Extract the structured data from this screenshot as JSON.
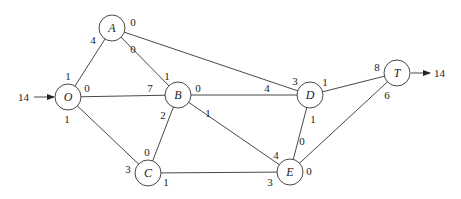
{
  "diagram": {
    "type": "network-flow-graph",
    "source_inflow": {
      "value": "14",
      "into": "O"
    },
    "sink_outflow": {
      "value": "14",
      "from": "T"
    },
    "nodes": [
      {
        "id": "O",
        "label": "O",
        "x": 68,
        "y": 97
      },
      {
        "id": "A",
        "label": "A",
        "x": 112,
        "y": 28
      },
      {
        "id": "B",
        "label": "B",
        "x": 178,
        "y": 95
      },
      {
        "id": "C",
        "label": "C",
        "x": 148,
        "y": 173
      },
      {
        "id": "D",
        "label": "D",
        "x": 310,
        "y": 95
      },
      {
        "id": "E",
        "label": "E",
        "x": 290,
        "y": 172
      },
      {
        "id": "T",
        "label": "T",
        "x": 397,
        "y": 73
      }
    ],
    "edges": [
      {
        "from": "O",
        "to": "A",
        "label_from": "1",
        "label_to": "4"
      },
      {
        "from": "O",
        "to": "B",
        "label_from": "0",
        "label_to": "7"
      },
      {
        "from": "O",
        "to": "C",
        "label_from": "1",
        "label_to": "3"
      },
      {
        "from": "A",
        "to": "B",
        "label_from": "0",
        "label_to": "1"
      },
      {
        "from": "A",
        "to": "D",
        "label_from": "0",
        "label_to": "3"
      },
      {
        "from": "B",
        "to": "D",
        "label_from": "0",
        "label_to": "4"
      },
      {
        "from": "B",
        "to": "C",
        "label_from": "2",
        "label_to": "0"
      },
      {
        "from": "B",
        "to": "E",
        "label_from": "1",
        "label_to": "4"
      },
      {
        "from": "C",
        "to": "E",
        "label_from": "1",
        "label_to": "3"
      },
      {
        "from": "D",
        "to": "T",
        "label_from": "1",
        "label_to": "8"
      },
      {
        "from": "D",
        "to": "E",
        "label_from": "1",
        "label_to": "0"
      },
      {
        "from": "E",
        "to": "T",
        "label_from": "0",
        "label_to": "6"
      }
    ]
  },
  "labels": {
    "OA_O": "1",
    "OA_A": "4",
    "OB_O": "0",
    "OB_B": "7",
    "OC_O": "1",
    "OC_C": "3",
    "AB_A": "0",
    "AB_B": "1",
    "AD_A": "0",
    "AD_D": "3",
    "BD_B": "0",
    "BD_D": "4",
    "BC_B": "2",
    "BC_C": "0",
    "BE_B": "1",
    "BE_E": "4",
    "CE_C": "1",
    "CE_E": "3",
    "DT_D": "1",
    "DT_T": "8",
    "DE_D": "1",
    "DE_E": "0",
    "ET_E": "0",
    "ET_T": "6",
    "in": "14",
    "out": "14"
  },
  "node_labels": {
    "O": "O",
    "A": "A",
    "B": "B",
    "C": "C",
    "D": "D",
    "E": "E",
    "T": "T"
  }
}
